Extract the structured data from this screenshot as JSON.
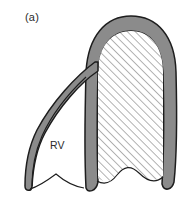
{
  "figure": {
    "panel_label": "(a)",
    "type": "anatomical-diagram",
    "annotations": [
      {
        "id": "rv",
        "text": "RV",
        "x": 50,
        "y": 139
      }
    ],
    "caption_ghost": "",
    "colors": {
      "background": "#ffffff",
      "myocardium_wall": "#8b8b8b",
      "outline": "#1d1d1d",
      "hatch_line": "#6e6e6e",
      "cavity_fill": "#ffffff",
      "label_text": "#2b2b2b"
    },
    "regions": [
      {
        "id": "lv-cavity",
        "name": "left-ventricle-cavity",
        "fill": "hatched",
        "hatch_angle_deg": 45,
        "hatch_spacing_px": 5.5
      },
      {
        "id": "rv-cavity",
        "name": "right-ventricle-cavity",
        "fill": "blank",
        "label": "RV"
      },
      {
        "id": "septum",
        "name": "interventricular-septum",
        "fill": "solid-gray"
      },
      {
        "id": "lv-free-wall",
        "name": "left-ventricle-free-wall",
        "fill": "solid-gray"
      },
      {
        "id": "rv-free-wall",
        "name": "right-ventricle-free-wall",
        "fill": "solid-gray"
      },
      {
        "id": "annulus",
        "name": "valve-annulus-scalloped-base",
        "fill": "none"
      }
    ]
  }
}
